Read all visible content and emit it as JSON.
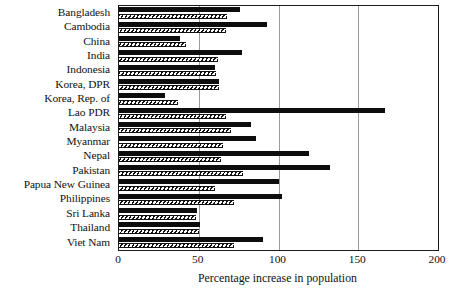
{
  "chart_data": {
    "type": "bar",
    "orientation": "horizontal",
    "title": "",
    "xlabel": "Percentage increase in population",
    "ylabel": "",
    "xlim": [
      0,
      200
    ],
    "xticks": [
      0,
      50,
      100,
      150,
      200
    ],
    "xticklabels": [
      "0",
      "50",
      "100",
      "150",
      "200"
    ],
    "grid": "vertical",
    "legend": "none",
    "categories": [
      "Bangladesh",
      "Cambodia",
      "China",
      "India",
      "Indonesia",
      "Korea, DPR",
      "Korea, Rep. of",
      "Lao PDR",
      "Malaysia",
      "Myanmar",
      "Nepal",
      "Pakistan",
      "Papua New Guinea",
      "Philippines",
      "Sri Lanka",
      "Thailand",
      "Viet Nam"
    ],
    "series": [
      {
        "name": "series-solid",
        "style": "solid-black",
        "color": "#0d0d0d",
        "values": [
          76,
          93,
          38,
          77,
          60,
          63,
          29,
          167,
          83,
          86,
          119,
          132,
          100,
          102,
          49,
          51,
          90
        ]
      },
      {
        "name": "series-hatched",
        "style": "diagonal-hatch",
        "color": "#111111",
        "values": [
          68,
          67,
          42,
          62,
          61,
          63,
          37,
          67,
          70,
          65,
          64,
          78,
          60,
          72,
          48,
          50,
          72
        ]
      }
    ]
  }
}
